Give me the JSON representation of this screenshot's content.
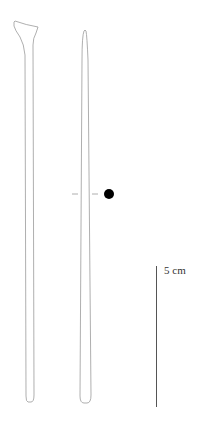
{
  "figure": {
    "type": "archaeological-artifact-drawing",
    "objects": [
      {
        "name": "artifact-left",
        "description": "elongated tool with flared head",
        "view": "profile"
      },
      {
        "name": "artifact-right",
        "description": "elongated tapering rod",
        "view": "profile"
      }
    ],
    "section_marker": {
      "style": "dashed",
      "symbol": "filled-dot"
    },
    "scale_bar": {
      "label": "5 cm",
      "length_cm": 5
    }
  },
  "colors": {
    "outline": "#9a9a9a",
    "scale_bar": "#555555",
    "dot": "#000000",
    "background": "#ffffff"
  }
}
